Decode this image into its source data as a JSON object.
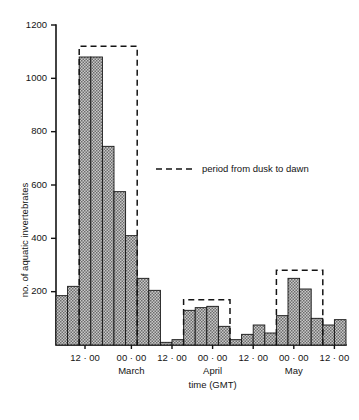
{
  "chart_data": {
    "type": "bar",
    "title": "",
    "subtitle": "",
    "xlabel": "time (GMT)",
    "ylabel": "no. of aquatic invertebrates",
    "ylim": [
      0,
      1200
    ],
    "ytick_values": [
      200,
      400,
      600,
      800,
      1000,
      1200
    ],
    "ytick_labels": [
      "200",
      "400",
      "600",
      "800",
      "1000",
      "1200"
    ],
    "grid": false,
    "legend_position": "inside-upper-right",
    "legend": [
      {
        "label": "period from dusk to dawn",
        "style": "dashed-line",
        "color": "#141414"
      }
    ],
    "xtick_labels": [
      "12 · 00",
      "00 · 00",
      "12 · 00",
      "00 · 00",
      "12 · 00",
      "00 · 00",
      "12 · 00"
    ],
    "month_labels": [
      "March",
      "April",
      "May"
    ],
    "bar_fill": "#a8a8a8",
    "bar_edge": "#141414",
    "categories": [
      "b1",
      "b2",
      "b3",
      "b4",
      "b5",
      "b6",
      "b7",
      "b8",
      "b9",
      "b10",
      "b11",
      "b12",
      "b13",
      "b14",
      "b15",
      "b16",
      "b17",
      "b18",
      "b19",
      "b20",
      "b21",
      "b22",
      "b23",
      "b24",
      "b25"
    ],
    "values": [
      185,
      220,
      1080,
      1080,
      745,
      575,
      410,
      250,
      205,
      10,
      20,
      130,
      140,
      145,
      70,
      20,
      40,
      75,
      45,
      110,
      250,
      210,
      100,
      75,
      95
    ],
    "dusk_spans": [
      {
        "start_index": 2,
        "end_index": 6,
        "top_value": 1120
      },
      {
        "start_index": 11,
        "end_index": 14,
        "top_value": 170
      },
      {
        "start_index": 19,
        "end_index": 22,
        "top_value": 280
      }
    ]
  },
  "figure": {
    "y_axis_label": "no. of aquatic invertebrates",
    "x_axis_label": "time (GMT)",
    "legend_label": "period from dusk to dawn"
  }
}
